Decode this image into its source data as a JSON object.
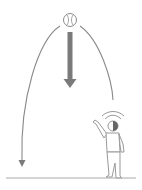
{
  "diagram": {
    "title": "Ball thrown upward falls back down",
    "elements": [
      {
        "id": "ball",
        "label": "baseball",
        "icon": "baseball-icon"
      },
      {
        "id": "trajectory",
        "label": "parabolic trajectory arc"
      },
      {
        "id": "fall-arrow",
        "label": "downward gravity arrow"
      },
      {
        "id": "person",
        "label": "person throwing / waving"
      },
      {
        "id": "motion-arcs",
        "label": "motion arcs above head"
      },
      {
        "id": "ground",
        "label": "ground line"
      }
    ],
    "colors": {
      "line": "#8a8a8a",
      "arrow": "#7a7a7a",
      "figure": "#999999",
      "head_shade": "#666666",
      "background": "#ffffff"
    }
  }
}
